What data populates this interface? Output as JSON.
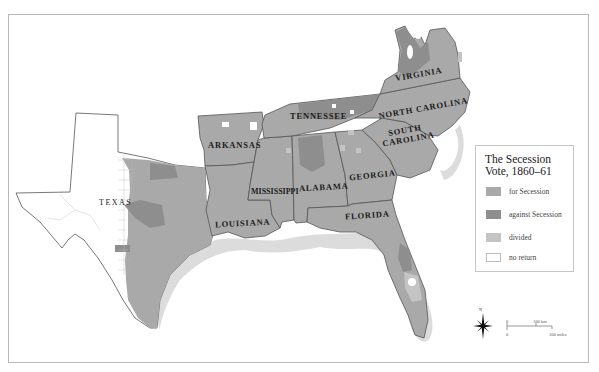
{
  "legend": {
    "title": "The Secession Vote, 1860–61",
    "items": [
      {
        "label": "for Secession",
        "color": "#a9a9a9"
      },
      {
        "label": "against Secession",
        "color": "#8e8e8e"
      },
      {
        "label": "divided",
        "color": "#c4c4c4"
      },
      {
        "label": "no return",
        "color": "#ffffff"
      }
    ]
  },
  "states": [
    {
      "name": "VIRGINIA"
    },
    {
      "name": "NORTH CAROLINA"
    },
    {
      "name": "TENNESSEE"
    },
    {
      "name": "ARKANSAS"
    },
    {
      "name": "SOUTH CAROLINA"
    },
    {
      "name": "MISSISSIPPI"
    },
    {
      "name": "ALABAMA"
    },
    {
      "name": "GEORGIA"
    },
    {
      "name": "TEXAS"
    },
    {
      "name": "LOUISIANA"
    },
    {
      "name": "FLORIDA"
    }
  ],
  "labels": {
    "south_carolina_line1": "SOUTH",
    "south_carolina_line2": "CAROLINA"
  },
  "compass": {
    "north_label": "N"
  },
  "scale": {
    "km_zero": "0",
    "km_label": "100 km",
    "mi_zero": "0",
    "mi_label": "100 miles"
  },
  "colors": {
    "for_secession": "#a9a9a9",
    "against_secession": "#8e8e8e",
    "divided": "#c4c4c4",
    "no_return": "#ffffff",
    "coast_halo": "#dadada",
    "border": "#555555"
  }
}
